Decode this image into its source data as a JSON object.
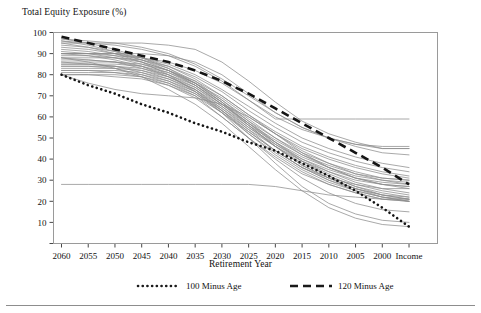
{
  "chart_data": {
    "type": "line",
    "title": "",
    "ylabel": "Total Equity Exposure (%)",
    "xlabel": "Retirement Year",
    "ylim": [
      0,
      100
    ],
    "yticks": [
      10,
      20,
      30,
      40,
      50,
      60,
      70,
      80,
      90,
      100
    ],
    "categories": [
      "2060",
      "2055",
      "2050",
      "2045",
      "2040",
      "2035",
      "2030",
      "2025",
      "2020",
      "2015",
      "2010",
      "2005",
      "2000",
      "Income"
    ],
    "grid": false,
    "legend_position": "bottom",
    "legend": [
      {
        "name": "100 Minus Age",
        "style": "dotted",
        "color": "#1a1a1a"
      },
      {
        "name": "120 Minus Age",
        "style": "dashed",
        "color": "#1a1a1a"
      }
    ],
    "series": [
      {
        "name": "100 Minus Age",
        "style": "dotted",
        "values": [
          80,
          75,
          71,
          66,
          62,
          57,
          53,
          48,
          44,
          38,
          32,
          25,
          17,
          8
        ]
      },
      {
        "name": "120 Minus Age",
        "style": "dashed",
        "values": [
          98,
          95,
          92,
          89,
          86,
          82,
          77,
          71,
          64,
          57,
          50,
          43,
          36,
          28
        ]
      },
      {
        "name": "Glide Path 1",
        "style": "solid",
        "values": [
          95,
          95,
          95,
          95,
          94,
          92,
          86,
          77,
          67,
          58,
          52,
          48,
          45,
          45
        ]
      },
      {
        "name": "Glide Path 2",
        "style": "solid",
        "values": [
          90,
          90,
          90,
          90,
          89,
          86,
          80,
          71,
          62,
          55,
          50,
          47,
          45,
          45
        ]
      },
      {
        "name": "Glide Path 3",
        "style": "solid",
        "values": [
          97,
          96,
          95,
          93,
          90,
          85,
          78,
          70,
          62,
          55,
          50,
          46,
          43,
          42
        ]
      },
      {
        "name": "Glide Path 4",
        "style": "solid",
        "values": [
          90,
          90,
          90,
          88,
          85,
          80,
          73,
          65,
          57,
          50,
          45,
          41,
          38,
          36
        ]
      },
      {
        "name": "Glide Path 5",
        "style": "solid",
        "values": [
          88,
          88,
          88,
          87,
          84,
          79,
          72,
          63,
          55,
          48,
          43,
          39,
          36,
          34
        ]
      },
      {
        "name": "Glide Path 6",
        "style": "solid",
        "values": [
          86,
          86,
          86,
          85,
          82,
          77,
          70,
          61,
          53,
          46,
          41,
          37,
          34,
          32
        ]
      },
      {
        "name": "Glide Path 7",
        "style": "solid",
        "values": [
          85,
          85,
          85,
          84,
          81,
          76,
          69,
          60,
          52,
          45,
          40,
          36,
          33,
          31
        ]
      },
      {
        "name": "Glide Path 8",
        "style": "solid",
        "values": [
          84,
          84,
          84,
          83,
          80,
          75,
          67,
          58,
          50,
          43,
          38,
          34,
          31,
          30
        ]
      },
      {
        "name": "Glide Path 9",
        "style": "solid",
        "values": [
          83,
          83,
          83,
          82,
          79,
          74,
          66,
          57,
          49,
          42,
          37,
          33,
          31,
          30
        ]
      },
      {
        "name": "Glide Path 10",
        "style": "solid",
        "values": [
          82,
          82,
          82,
          81,
          78,
          73,
          65,
          56,
          48,
          41,
          36,
          32,
          30,
          29
        ]
      },
      {
        "name": "Glide Path 11",
        "style": "solid",
        "values": [
          81,
          81,
          81,
          80,
          77,
          72,
          64,
          55,
          47,
          40,
          35,
          31,
          29,
          28
        ]
      },
      {
        "name": "Glide Path 12",
        "style": "solid",
        "values": [
          80,
          80,
          80,
          79,
          76,
          71,
          63,
          54,
          46,
          39,
          34,
          30,
          28,
          27
        ]
      },
      {
        "name": "Glide Path 13",
        "style": "solid",
        "values": [
          94,
          93,
          91,
          88,
          84,
          78,
          70,
          61,
          52,
          44,
          38,
          33,
          30,
          28
        ]
      },
      {
        "name": "Glide Path 14",
        "style": "solid",
        "values": [
          92,
          91,
          89,
          86,
          82,
          76,
          68,
          59,
          50,
          42,
          36,
          31,
          28,
          26
        ]
      },
      {
        "name": "Glide Path 15",
        "style": "solid",
        "values": [
          96,
          94,
          91,
          87,
          82,
          75,
          66,
          57,
          48,
          40,
          34,
          29,
          26,
          24
        ]
      },
      {
        "name": "Glide Path 16",
        "style": "solid",
        "values": [
          89,
          89,
          88,
          86,
          82,
          76,
          67,
          57,
          47,
          39,
          33,
          28,
          25,
          23
        ]
      },
      {
        "name": "Glide Path 17",
        "style": "solid",
        "values": [
          87,
          87,
          86,
          84,
          80,
          74,
          65,
          55,
          46,
          38,
          32,
          27,
          24,
          22
        ]
      },
      {
        "name": "Glide Path 18",
        "style": "solid",
        "values": [
          85,
          85,
          84,
          82,
          78,
          72,
          63,
          53,
          44,
          36,
          30,
          26,
          23,
          21
        ]
      },
      {
        "name": "Glide Path 19",
        "style": "solid",
        "values": [
          93,
          92,
          90,
          87,
          83,
          77,
          68,
          58,
          48,
          39,
          32,
          27,
          23,
          21
        ]
      },
      {
        "name": "Glide Path 20",
        "style": "solid",
        "values": [
          91,
          90,
          88,
          85,
          81,
          75,
          66,
          56,
          46,
          37,
          31,
          26,
          22,
          20
        ]
      },
      {
        "name": "Glide Path 21",
        "style": "solid",
        "values": [
          88,
          87,
          86,
          83,
          79,
          73,
          64,
          54,
          44,
          36,
          30,
          25,
          22,
          20
        ]
      },
      {
        "name": "Glide Path 22",
        "style": "solid",
        "values": [
          86,
          85,
          84,
          81,
          77,
          71,
          62,
          52,
          43,
          35,
          29,
          25,
          22,
          21
        ]
      },
      {
        "name": "Glide Path 23",
        "style": "solid",
        "values": [
          97,
          95,
          92,
          88,
          83,
          76,
          67,
          56,
          46,
          37,
          31,
          26,
          23,
          22
        ]
      },
      {
        "name": "Glide Path 24",
        "style": "solid",
        "values": [
          90,
          89,
          87,
          84,
          79,
          73,
          63,
          52,
          42,
          34,
          28,
          24,
          21,
          20
        ]
      },
      {
        "name": "Glide Path 25",
        "style": "solid",
        "values": [
          84,
          84,
          83,
          80,
          76,
          70,
          60,
          50,
          41,
          33,
          28,
          24,
          21,
          20
        ]
      },
      {
        "name": "Glide Path 26",
        "style": "solid",
        "values": [
          80,
          80,
          79,
          78,
          75,
          70,
          62,
          53,
          44,
          36,
          31,
          28,
          26,
          26
        ]
      },
      {
        "name": "Glide Path 27",
        "style": "solid",
        "values": [
          96,
          95,
          94,
          92,
          89,
          84,
          77,
          68,
          59,
          59,
          59,
          59,
          59,
          59
        ]
      },
      {
        "name": "Glide Path 28",
        "style": "solid",
        "values": [
          90,
          90,
          89,
          88,
          86,
          82,
          76,
          68,
          60,
          54,
          50,
          47,
          46,
          46
        ]
      },
      {
        "name": "Glide Path 29",
        "style": "solid",
        "values": [
          28,
          28,
          28,
          28,
          28,
          28,
          28,
          28,
          27,
          25,
          23,
          22,
          21,
          21
        ]
      },
      {
        "name": "Glide Path 30",
        "style": "solid",
        "values": [
          80,
          76,
          73,
          71,
          70,
          69,
          66,
          60,
          52,
          43,
          36,
          31,
          28,
          27
        ]
      },
      {
        "name": "Glide Path 31",
        "style": "solid",
        "values": [
          82,
          82,
          81,
          79,
          75,
          69,
          60,
          50,
          40,
          31,
          24,
          19,
          16,
          15
        ]
      },
      {
        "name": "Glide Path 32",
        "style": "solid",
        "values": [
          88,
          86,
          83,
          79,
          73,
          66,
          57,
          46,
          35,
          25,
          17,
          12,
          9,
          8
        ]
      },
      {
        "name": "Glide Path 33",
        "style": "solid",
        "values": [
          95,
          93,
          90,
          86,
          80,
          72,
          62,
          50,
          38,
          27,
          19,
          14,
          11,
          10
        ]
      }
    ]
  },
  "legend_markers": {
    "dotted_marker": "dotted-line-marker",
    "dashed_marker": "dashed-line-marker"
  }
}
